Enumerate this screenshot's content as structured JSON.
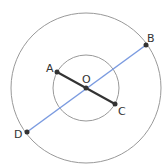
{
  "diagram": {
    "center": {
      "label": "O",
      "x": 86,
      "y": 88
    },
    "outer_circle": {
      "r": 75,
      "color": "#999999"
    },
    "inner_circle": {
      "r": 33,
      "color": "#999999"
    },
    "points": {
      "A": {
        "label": "A",
        "x": 57,
        "y": 72
      },
      "B": {
        "label": "B",
        "x": 146,
        "y": 45
      },
      "C": {
        "label": "C",
        "x": 115,
        "y": 104
      },
      "D": {
        "label": "D",
        "x": 27,
        "y": 132
      },
      "O": {
        "label": "O",
        "x": 86,
        "y": 88
      }
    },
    "segments": [
      {
        "from": "A",
        "to": "C",
        "color": "#333333"
      },
      {
        "from": "D",
        "to": "B",
        "color": "#7b9be0"
      }
    ]
  }
}
